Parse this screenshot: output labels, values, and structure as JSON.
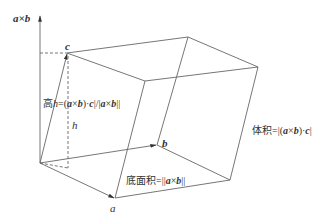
{
  "diagram": {
    "vectors": {
      "a": {
        "label": "a",
        "tail": [
          40,
          163
        ],
        "tip": [
          115,
          198
        ]
      },
      "b": {
        "label": "b",
        "tail": [
          40,
          163
        ],
        "tip": [
          157,
          145
        ]
      },
      "c": {
        "label": "c",
        "tail": [
          40,
          163
        ],
        "tip": [
          67,
          53
        ]
      },
      "axb": {
        "label": "a×b",
        "tail": [
          40,
          163
        ],
        "tip": [
          40,
          15
        ]
      }
    },
    "vertices": {
      "O": [
        40,
        163
      ],
      "a": [
        115,
        198
      ],
      "b": [
        157,
        145
      ],
      "ab": [
        230,
        180
      ],
      "c": [
        67,
        53
      ],
      "ca": [
        145,
        81
      ],
      "cb": [
        188,
        37
      ],
      "cab": [
        258,
        67
      ]
    },
    "labels": {
      "axb_label": "a×b",
      "c_label": "c",
      "b_label": "b",
      "a_label": "a",
      "h_label": "h",
      "height_formula": "高h=(a×b)·c|/|a×b|",
      "height_prefix": "高",
      "height_h": "h",
      "height_eq": "=(",
      "base_prefix": "底面积=||",
      "base_suffix": "||",
      "volume_prefix": "体积=|(",
      "volume_suffix": "|"
    },
    "colors": {
      "line": "#555555",
      "text": "#333333",
      "background": "#ffffff"
    }
  }
}
